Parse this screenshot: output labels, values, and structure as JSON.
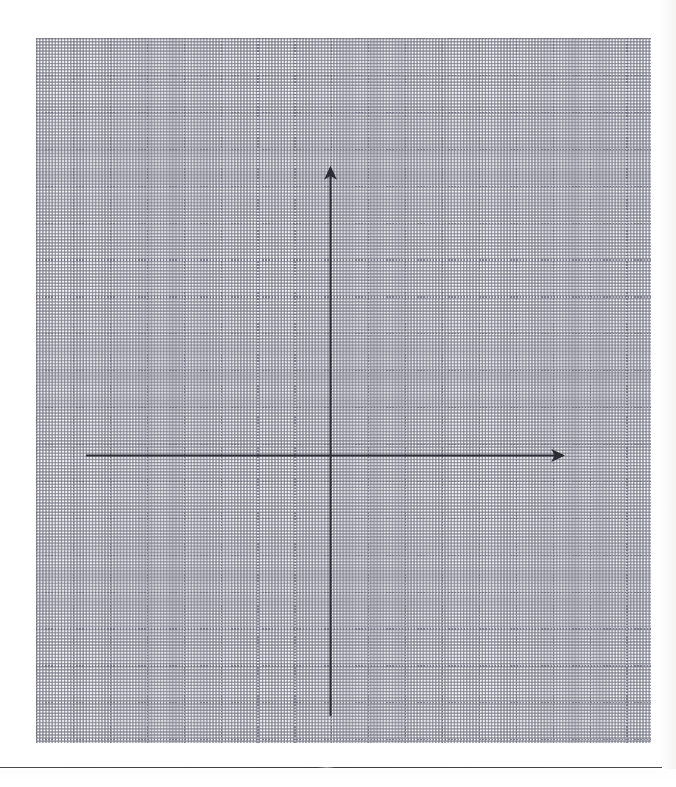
{
  "document": {
    "title": "Graph paper with coordinate axes",
    "page_width": 676,
    "page_height": 787,
    "background_color": "#ffffff",
    "paper_edge_color": "#f4f3f2"
  },
  "grid": {
    "name": "dotted-graph-paper",
    "left": 36,
    "top": 38,
    "width": 615,
    "height": 705,
    "minor_cell_px": 12.3,
    "major_every_n_cells": 3,
    "major_cell_px": 36.9,
    "minor_dot_color": "#9696a5",
    "major_dot_color": "#6c6c7e",
    "dot_period_px": 3.1,
    "columns_minor": 50,
    "rows_minor": 57,
    "columns_major": 17,
    "rows_major": 19
  },
  "chart_data": {
    "type": "line",
    "title": "",
    "subtitle": "",
    "xlabel": "",
    "ylabel": "",
    "grid": true,
    "legend": "none",
    "annotations": [],
    "series": [],
    "categories": [],
    "values": [],
    "axes": {
      "style": "blank cartesian coordinate plane",
      "origin_px": {
        "x": 330,
        "y": 455
      },
      "stroke_color": "#2b2b33",
      "stroke_width_px": 2,
      "x_axis": {
        "name": "x-axis",
        "start_px": {
          "x": 86,
          "y": 455
        },
        "end_px": {
          "x": 570,
          "y": 455
        },
        "arrowhead": "right",
        "tick_labels": [],
        "label": ""
      },
      "y_axis": {
        "name": "y-axis",
        "start_px": {
          "x": 330,
          "y": 716
        },
        "end_px": {
          "x": 330,
          "y": 161
        },
        "arrowhead": "up",
        "tick_labels": [],
        "label": ""
      }
    }
  },
  "footer": {
    "rule_label": "horizontal-separator-rule",
    "rule_color": "#3d3d3d",
    "rule_top": 767,
    "rule_width": 662
  }
}
